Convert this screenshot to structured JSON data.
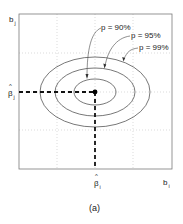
{
  "figure": {
    "caption": "(a)",
    "axes": {
      "x_label": "b",
      "x_label_sub": "i",
      "y_label": "b",
      "y_label_sub": "j",
      "x_estimate_label": "β",
      "x_estimate_sub": "i",
      "y_estimate_label": "β",
      "y_estimate_sub": "j",
      "hat": "^"
    },
    "contours": [
      {
        "label": "p = 90%"
      },
      {
        "label": "p = 95%"
      },
      {
        "label": "p = 99%"
      }
    ],
    "colors": {
      "frame": "#777777",
      "grid": "#bbbbbb",
      "ellipse": "#555555",
      "dashed": "#111111",
      "point": "#000000"
    }
  }
}
